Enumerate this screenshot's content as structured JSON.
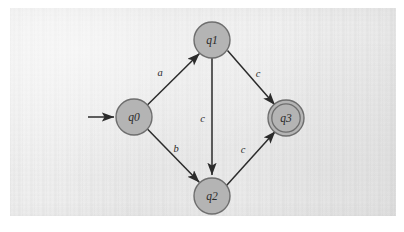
{
  "figure": {
    "kind": "finite-state-automaton",
    "background": "scanned-paper",
    "frame_color": "#d8d8d8"
  },
  "style": {
    "node_fill": "#b4b4b4",
    "node_stroke": "#6e6e6e",
    "edge_color": "#2b2b2b",
    "label_color": "#2b2b2b",
    "paper_color": "#eeeeee"
  },
  "states": [
    {
      "id": "q0",
      "label": "q0",
      "cx": 134,
      "cy": 117,
      "r": 18,
      "accepting": false,
      "start": true
    },
    {
      "id": "q1",
      "label": "q1",
      "cx": 212,
      "cy": 40,
      "r": 18,
      "accepting": false,
      "start": false
    },
    {
      "id": "q2",
      "label": "q2",
      "cx": 212,
      "cy": 196,
      "r": 18,
      "accepting": false,
      "start": false
    },
    {
      "id": "q3",
      "label": "q3",
      "cx": 286,
      "cy": 118,
      "r": 18,
      "accepting": true,
      "start": false
    }
  ],
  "start_arrow": {
    "name": "start-arrow",
    "x1": 88,
    "y1": 117,
    "x2": 114,
    "y2": 117
  },
  "transitions": [
    {
      "from": "q0",
      "to": "q1",
      "symbol": "a",
      "label_x": 160,
      "label_y": 76
    },
    {
      "from": "q0",
      "to": "q2",
      "symbol": "b",
      "label_x": 176,
      "label_y": 152
    },
    {
      "from": "q1",
      "to": "q3",
      "symbol": "c",
      "label_x": 258,
      "label_y": 77
    },
    {
      "from": "q1",
      "to": "q2",
      "symbol": "c",
      "label_x": 205,
      "label_y": 122
    },
    {
      "from": "q2",
      "to": "q3",
      "symbol": "c",
      "label_x": 243,
      "label_y": 153
    }
  ]
}
